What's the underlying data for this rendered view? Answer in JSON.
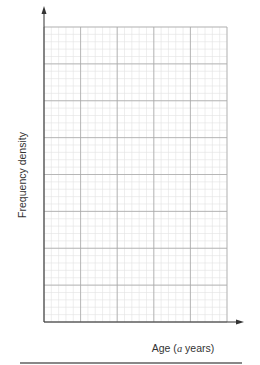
{
  "chart_data": {
    "type": "histogram",
    "title": "",
    "xlabel": "Age (a years)",
    "ylabel": "Frequency density",
    "xlim": [
      0,
      5
    ],
    "ylim": [
      0,
      32
    ],
    "x_ticks": [
      "1",
      "2",
      "3",
      "4",
      "5"
    ],
    "y_ticks": [
      "0",
      "4",
      "8",
      "12",
      "16",
      "20",
      "24",
      "28",
      "32"
    ],
    "grid": true,
    "bins": [
      {
        "from": 0,
        "to": 0.5,
        "value": 16
      },
      {
        "from": 0.5,
        "to": 1,
        "value": 24
      },
      {
        "from": 1,
        "to": 2,
        "value": 16
      },
      {
        "from": 2,
        "to": 3,
        "value": 30
      },
      {
        "from": 3,
        "to": 5,
        "value": 14
      }
    ],
    "bar_color": "#c4c4c4",
    "edge_color": "#444444"
  },
  "labels": {
    "x_axis": "Age (a years)",
    "x_axis_prefix": "Age (",
    "x_axis_var": "a",
    "x_axis_suffix": " years)",
    "y_axis": "Frequency density"
  }
}
